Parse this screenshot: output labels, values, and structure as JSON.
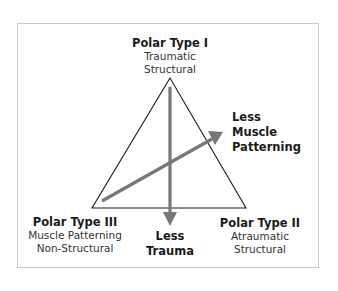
{
  "vertices": {
    "top": {
      "title": "Polar Type I",
      "lines": [
        "Traumatic",
        "Structural"
      ]
    },
    "right": {
      "title": "Polar Type II",
      "lines": [
        "Atraumatic",
        "Structural"
      ]
    },
    "left": {
      "title": "Polar Type III",
      "lines": [
        "Muscle Patterning",
        "Non-Structural"
      ]
    }
  },
  "arrows": {
    "vertical": {
      "lines": [
        "Less",
        "Trauma"
      ]
    },
    "diagonal": {
      "lines": [
        "Less",
        "Muscle",
        "Patterning"
      ]
    }
  },
  "colors": {
    "arrow": "#777777",
    "triangle": "#1a1a1a",
    "frame": "#c8c8c8"
  }
}
